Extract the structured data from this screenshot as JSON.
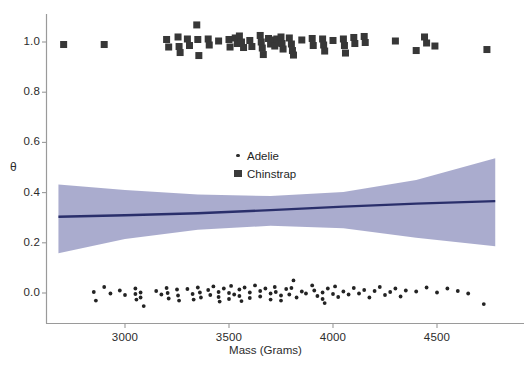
{
  "chart_data": {
    "type": "scatter",
    "title": "",
    "xlabel": "Mass (Grams)",
    "ylabel": "θ",
    "xlim": [
      2680,
      4790
    ],
    "ylim": [
      -0.085,
      1.09
    ],
    "xticks": [
      3000,
      3500,
      4000,
      4500
    ],
    "xtick_labels": [
      "3000",
      "3500",
      "4000",
      "4500"
    ],
    "yticks": [
      0.0,
      0.2,
      0.4,
      0.6,
      0.8,
      1.0
    ],
    "ytick_labels": [
      "0.0",
      "0.2",
      "0.4",
      "0.6",
      "0.8",
      "1.0"
    ],
    "grid": false,
    "legend_position": "center",
    "legend": [
      {
        "label": "Adelie",
        "marker": "dot",
        "color": "#2e2e2e"
      },
      {
        "label": "Chinstrap",
        "marker": "square",
        "color": "#3b3b3b"
      }
    ],
    "series": [
      {
        "name": "Adelie",
        "marker": "dot",
        "color": "#232323",
        "points": [
          [
            2850,
            0.004
          ],
          [
            2860,
            -0.03
          ],
          [
            2900,
            0.024
          ],
          [
            2930,
            -0.002
          ],
          [
            2975,
            0.01
          ],
          [
            3000,
            -0.008
          ],
          [
            3050,
            0.018
          ],
          [
            3050,
            -0.004
          ],
          [
            3055,
            -0.026
          ],
          [
            3075,
            0.002
          ],
          [
            3075,
            -0.018
          ],
          [
            3090,
            -0.052
          ],
          [
            3150,
            0.008
          ],
          [
            3175,
            -0.006
          ],
          [
            3200,
            0.02
          ],
          [
            3205,
            0.0
          ],
          [
            3210,
            -0.022
          ],
          [
            3250,
            0.014
          ],
          [
            3255,
            -0.01
          ],
          [
            3260,
            -0.03
          ],
          [
            3300,
            0.016
          ],
          [
            3325,
            -0.004
          ],
          [
            3330,
            -0.026
          ],
          [
            3350,
            0.022
          ],
          [
            3360,
            0.002
          ],
          [
            3365,
            -0.018
          ],
          [
            3400,
            0.012
          ],
          [
            3410,
            -0.008
          ],
          [
            3425,
            0.026
          ],
          [
            3450,
            0.004
          ],
          [
            3450,
            -0.016
          ],
          [
            3455,
            -0.034
          ],
          [
            3475,
            0.018
          ],
          [
            3500,
            0.0
          ],
          [
            3500,
            -0.024
          ],
          [
            3510,
            0.028
          ],
          [
            3525,
            -0.006
          ],
          [
            3550,
            0.014
          ],
          [
            3550,
            -0.012
          ],
          [
            3560,
            -0.032
          ],
          [
            3575,
            0.022
          ],
          [
            3600,
            0.002
          ],
          [
            3600,
            -0.02
          ],
          [
            3625,
            0.03
          ],
          [
            3650,
            0.008
          ],
          [
            3650,
            -0.014
          ],
          [
            3675,
            0.018
          ],
          [
            3700,
            -0.002
          ],
          [
            3700,
            -0.026
          ],
          [
            3720,
            0.024
          ],
          [
            3725,
            0.004
          ],
          [
            3750,
            -0.01
          ],
          [
            3750,
            -0.03
          ],
          [
            3775,
            0.016
          ],
          [
            3790,
            -0.006
          ],
          [
            3800,
            0.02
          ],
          [
            3810,
            0.05
          ],
          [
            3825,
            -0.018
          ],
          [
            3850,
            0.006
          ],
          [
            3870,
            -0.002
          ],
          [
            3900,
            0.03
          ],
          [
            3910,
            0.01
          ],
          [
            3925,
            -0.012
          ],
          [
            3950,
            0.002
          ],
          [
            3950,
            -0.024
          ],
          [
            3960,
            -0.04
          ],
          [
            3975,
            0.018
          ],
          [
            4000,
            -0.004
          ],
          [
            4010,
            0.026
          ],
          [
            4025,
            -0.016
          ],
          [
            4050,
            0.006
          ],
          [
            4075,
            -0.006
          ],
          [
            4100,
            0.02
          ],
          [
            4125,
            -0.002
          ],
          [
            4150,
            0.012
          ],
          [
            4175,
            -0.018
          ],
          [
            4200,
            0.008
          ],
          [
            4225,
            0.024
          ],
          [
            4250,
            -0.008
          ],
          [
            4275,
            0.004
          ],
          [
            4300,
            0.018
          ],
          [
            4325,
            -0.014
          ],
          [
            4350,
            0.01
          ],
          [
            4400,
            0.006
          ],
          [
            4450,
            0.022
          ],
          [
            4500,
            0.002
          ],
          [
            4550,
            0.018
          ],
          [
            4600,
            0.008
          ],
          [
            4650,
            -0.002
          ],
          [
            4725,
            -0.044
          ]
        ]
      },
      {
        "name": "Chinstrap",
        "marker": "square",
        "color": "#373737",
        "points": [
          [
            2705,
            0.99
          ],
          [
            2900,
            0.99
          ],
          [
            3200,
            1.01
          ],
          [
            3210,
            0.98
          ],
          [
            3255,
            1.02
          ],
          [
            3260,
            0.982
          ],
          [
            3265,
            0.958
          ],
          [
            3300,
            1.012
          ],
          [
            3310,
            0.986
          ],
          [
            3345,
            1.068
          ],
          [
            3350,
            1.01
          ],
          [
            3355,
            0.946
          ],
          [
            3400,
            1.012
          ],
          [
            3405,
            0.988
          ],
          [
            3450,
            1.004
          ],
          [
            3500,
            1.01
          ],
          [
            3505,
            0.98
          ],
          [
            3530,
            1.016
          ],
          [
            3540,
            0.994
          ],
          [
            3550,
            1.024
          ],
          [
            3560,
            1.0
          ],
          [
            3570,
            0.978
          ],
          [
            3600,
            1.006
          ],
          [
            3610,
            0.982
          ],
          [
            3650,
            1.026
          ],
          [
            3655,
            1.0
          ],
          [
            3660,
            0.976
          ],
          [
            3665,
            0.95
          ],
          [
            3690,
            1.014
          ],
          [
            3700,
            0.992
          ],
          [
            3710,
            1.008
          ],
          [
            3720,
            0.984
          ],
          [
            3730,
            1.012
          ],
          [
            3740,
            0.996
          ],
          [
            3750,
            1.02
          ],
          [
            3755,
            0.994
          ],
          [
            3760,
            0.972
          ],
          [
            3790,
            1.016
          ],
          [
            3800,
            0.992
          ],
          [
            3805,
            0.966
          ],
          [
            3810,
            0.948
          ],
          [
            3850,
            1.008
          ],
          [
            3900,
            1.014
          ],
          [
            3905,
            0.986
          ],
          [
            3950,
            1.012
          ],
          [
            3955,
            0.988
          ],
          [
            3960,
            0.964
          ],
          [
            4000,
            1.006
          ],
          [
            4050,
            1.012
          ],
          [
            4055,
            0.986
          ],
          [
            4060,
            0.956
          ],
          [
            4100,
            1.018
          ],
          [
            4105,
            0.994
          ],
          [
            4150,
            1.022
          ],
          [
            4155,
            0.998
          ],
          [
            4300,
            1.004
          ],
          [
            4400,
            0.966
          ],
          [
            4440,
            1.02
          ],
          [
            4450,
            0.996
          ],
          [
            4490,
            0.984
          ],
          [
            4740,
            0.97
          ]
        ]
      }
    ],
    "fit_line": {
      "name": "logistic-fit",
      "color": "#2a2f6b",
      "x": [
        2680,
        3000,
        3350,
        3700,
        4050,
        4400,
        4780
      ],
      "y": [
        0.304,
        0.31,
        0.318,
        0.33,
        0.344,
        0.356,
        0.366
      ]
    },
    "confidence_band": {
      "name": "confidence-interval",
      "color": "#9b9dc6",
      "opacity": 0.85,
      "x": [
        2680,
        3000,
        3350,
        3700,
        4050,
        4400,
        4780
      ],
      "upper": [
        0.432,
        0.41,
        0.392,
        0.386,
        0.402,
        0.45,
        0.537
      ],
      "lower": [
        0.158,
        0.215,
        0.252,
        0.268,
        0.258,
        0.22,
        0.186
      ]
    }
  },
  "axes": {
    "x_label": "Mass (Grams)",
    "y_label": "θ",
    "x_ticks": [
      "3000",
      "3500",
      "4000",
      "4500"
    ],
    "y_ticks": [
      "1.0",
      "0.8",
      "0.6",
      "0.4",
      "0.2",
      "0.0"
    ]
  },
  "legend": {
    "items": [
      {
        "label": "Adelie"
      },
      {
        "label": "Chinstrap"
      }
    ]
  },
  "colors": {
    "band": "#9b9dc6",
    "line": "#2a2f6b",
    "adelie": "#232323",
    "chinstrap": "#373737",
    "axis": "#9a9a9a",
    "text": "#2b2b2b"
  }
}
